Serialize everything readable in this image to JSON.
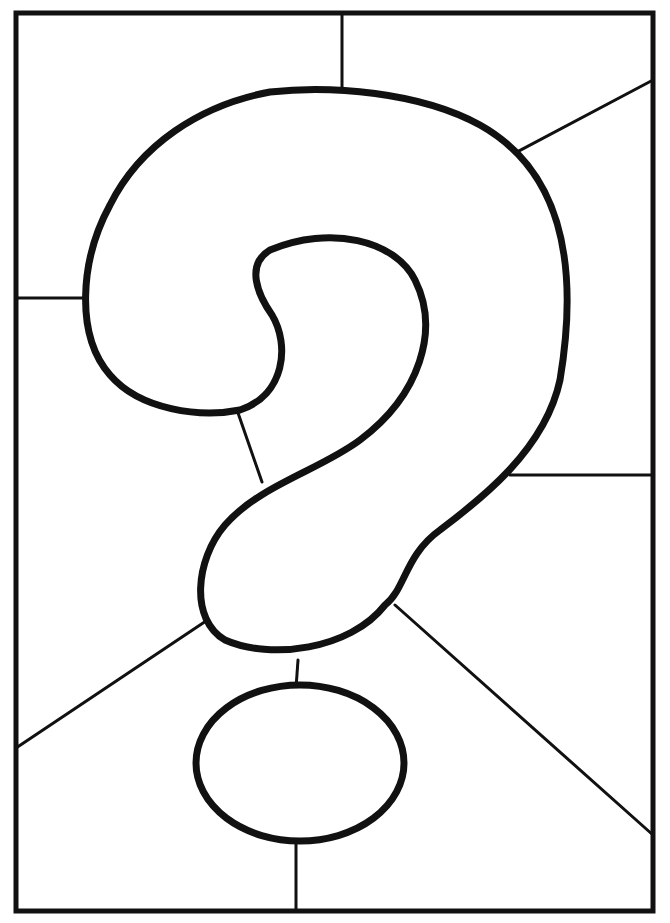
{
  "image": {
    "subject": "stained-glass question mark coloring page",
    "colors": {
      "line": "#111111",
      "background": "#ffffff"
    },
    "frame": {
      "x": 16,
      "y": 13,
      "width": 637,
      "height": 898
    }
  }
}
